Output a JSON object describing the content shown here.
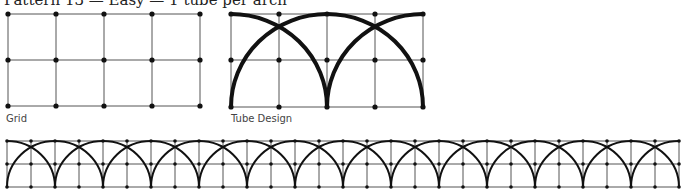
{
  "title": "Pattern 13 — Easy — 1 tube per arch",
  "figures": {
    "grid": {
      "caption": "Grid"
    },
    "tube_design": {
      "caption": "Tube Design"
    },
    "repeat": {
      "caption": ""
    }
  },
  "colors": {
    "line": "#555555",
    "tube": "#111111",
    "dot": "#111111"
  }
}
